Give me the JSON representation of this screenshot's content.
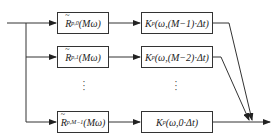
{
  "diagram": {
    "type": "block-diagram",
    "stage1": [
      {
        "base": "R",
        "sub": "p,0",
        "arg": "(Mω)"
      },
      {
        "base": "R",
        "sub": "p,1",
        "arg": "(Mω)"
      },
      {
        "base": "R",
        "sub": "p,M−1",
        "arg": "(Mω)"
      }
    ],
    "stage2": [
      {
        "base": "K",
        "sub": "p",
        "arg": "(ω,(M−1)·Δt)"
      },
      {
        "base": "K",
        "sub": "p",
        "arg": "(ω,(M−2)·Δt)"
      },
      {
        "base": "K",
        "sub": "p",
        "arg": "(ω,0·Δt)"
      }
    ],
    "ellipsis": "⋮",
    "line_color": "#333333"
  }
}
